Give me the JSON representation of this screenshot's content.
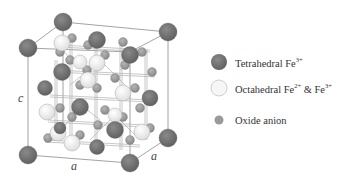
{
  "figure": {
    "type": "crystal-structure",
    "axis_labels": {
      "c": "c",
      "a_front": "a",
      "a_side": "a"
    }
  },
  "legend": {
    "items": [
      {
        "label": "Tetrahedral Fe",
        "sup": "3+",
        "suffix": "",
        "color": "#6e6e6e",
        "size": "large"
      },
      {
        "label": "Octahedral Fe",
        "sup": "2+",
        "mid": " & Fe",
        "sup2": "3+",
        "color": "#f2f2f2",
        "size": "large"
      },
      {
        "label": "Oxide anion",
        "color": "#9a9a9a",
        "size": "small"
      }
    ]
  },
  "colors": {
    "tetrahedral": "#6e6e6e",
    "octahedral": "#f0f0f0",
    "oxide": "#9a9a9a",
    "frame": "#8a8a8a"
  }
}
